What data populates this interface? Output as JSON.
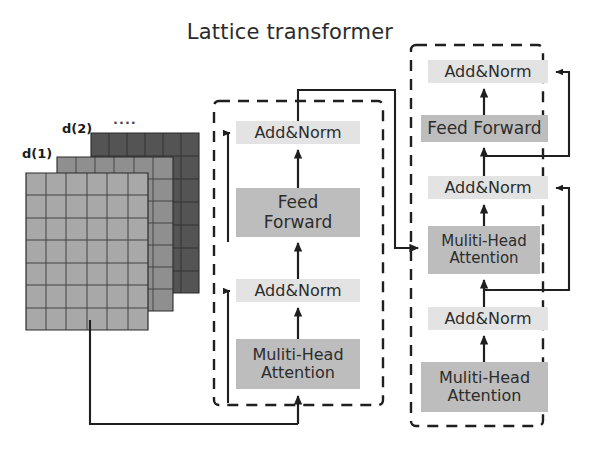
{
  "figure": {
    "title": "Lattice transformer",
    "background": "#ffffff"
  },
  "colors": {
    "addnorm_fill": "#e3e3e3",
    "block_fill": "#bdbdbd",
    "line": "#1f1f1f",
    "lattice_front": "#a8a8a8",
    "lattice_mid": "#8f8f8f",
    "lattice_back": "#545454",
    "text": "#2c2c2c"
  },
  "lattice": {
    "labels": {
      "layer1": "d(1)",
      "layer2": "d(2)",
      "ellipsis": "...."
    },
    "layers": 3,
    "grid_columns": 6,
    "grid_rows": 7
  },
  "encoder": {
    "name": "encoder-block",
    "modules": [
      {
        "id": "enc-addnorm-2",
        "label": "Add&Norm",
        "style": "addnorm"
      },
      {
        "id": "enc-ff",
        "label": "Feed\nForward",
        "style": "dark"
      },
      {
        "id": "enc-addnorm-1",
        "label": "Add&Norm",
        "style": "addnorm"
      },
      {
        "id": "enc-mha-1",
        "label": "Muliti-Head\nAttention",
        "style": "dark"
      }
    ]
  },
  "decoder": {
    "name": "decoder-block",
    "modules": [
      {
        "id": "dec-addnorm-3",
        "label": "Add&Norm",
        "style": "addnorm"
      },
      {
        "id": "dec-ff",
        "label": "Feed Forward",
        "style": "dark"
      },
      {
        "id": "dec-addnorm-2",
        "label": "Add&Norm",
        "style": "addnorm"
      },
      {
        "id": "dec-mha-2",
        "label": "Muliti-Head\nAttention",
        "style": "dark"
      },
      {
        "id": "dec-addnorm-1",
        "label": "Add&Norm",
        "style": "addnorm"
      },
      {
        "id": "dec-mha-1",
        "label": "Muliti-Head\nAttention",
        "style": "dark"
      }
    ]
  }
}
